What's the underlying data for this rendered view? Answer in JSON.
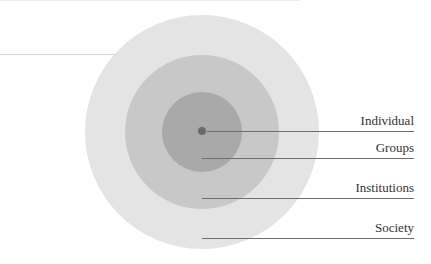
{
  "diagram": {
    "type": "concentric-circles",
    "center": {
      "x": 202,
      "y": 132
    },
    "rings": [
      {
        "name": "society-ring",
        "radius": 117,
        "color": "#e3e3e3"
      },
      {
        "name": "institutions-ring",
        "radius": 77,
        "color": "#c7c7c7"
      },
      {
        "name": "groups-ring",
        "radius": 40,
        "color": "#a8a8a8"
      }
    ],
    "core_dot": {
      "radius": 4,
      "color": "#6a6a6a"
    },
    "labels": [
      {
        "text": "Individual",
        "line_y": 131,
        "line_x1": 207
      },
      {
        "text": "Groups",
        "line_y": 158,
        "line_x1": 202
      },
      {
        "text": "Institutions",
        "line_y": 198,
        "line_x1": 202
      },
      {
        "text": "Society",
        "line_y": 238,
        "line_x1": 202
      }
    ],
    "line_x2": 414
  }
}
